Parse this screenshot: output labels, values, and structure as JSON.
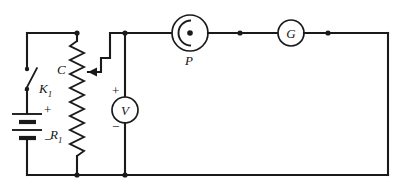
{
  "diagram": {
    "background_color": "#ffffff",
    "line_color": "#1a1a1a"
  },
  "components": {
    "switch": {
      "label": "K",
      "subscript": "1",
      "name": "switch-k1",
      "state": "open"
    },
    "battery": {
      "name": "battery",
      "plus_sign": "+",
      "minus_sign": "−",
      "cells": 2
    },
    "rheostat": {
      "label": "R",
      "subscript": "1",
      "name": "rheostat-r1",
      "type": "potentiometer"
    },
    "wiper": {
      "label": "C",
      "name": "wiper-contact-c"
    },
    "voltmeter": {
      "label": "V",
      "name": "voltmeter",
      "plus_sign": "+",
      "minus_sign": "−"
    },
    "photocell": {
      "label": "P",
      "name": "photocell"
    },
    "galvanometer": {
      "label": "G",
      "name": "galvanometer"
    }
  },
  "nodes": [
    {
      "name": "node-top-rheostat",
      "x": 77,
      "y": 33
    },
    {
      "name": "node-top-voltmeter",
      "x": 125,
      "y": 33
    },
    {
      "name": "node-photocell-anode",
      "x": 190,
      "y": 33
    },
    {
      "name": "node-wire-right-of-photocell",
      "x": 240,
      "y": 33
    },
    {
      "name": "node-wire-right-of-galvanometer",
      "x": 328,
      "y": 33
    },
    {
      "name": "node-bottom-rheostat",
      "x": 77,
      "y": 175
    },
    {
      "name": "node-bottom-voltmeter",
      "x": 125,
      "y": 175
    }
  ]
}
